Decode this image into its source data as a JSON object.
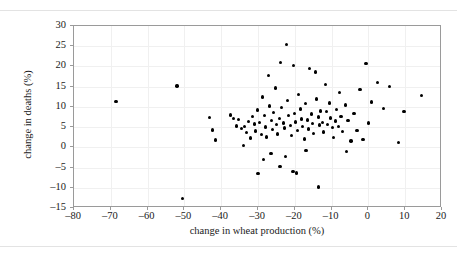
{
  "figure": {
    "caption_remnant": "",
    "background": "#ffffff",
    "frame_color": "#9a9a9a",
    "grid_color": "#f0f0f0",
    "point_color": "#000000"
  },
  "chart_data": {
    "type": "scatter",
    "title": "",
    "xlabel": "change in wheat production (%)",
    "ylabel": "change in deaths (%)",
    "xlim": [
      -80,
      20
    ],
    "ylim": [
      -15,
      30
    ],
    "xticks": [
      -80,
      -70,
      -60,
      -50,
      -40,
      -30,
      -20,
      -10,
      0,
      10,
      20
    ],
    "xticklabels": [
      "–80",
      "–70",
      "–60",
      "–50",
      "–40",
      "–30",
      "–20",
      "–10",
      "0",
      "10",
      "20"
    ],
    "yticks": [
      -15,
      -10,
      -5,
      0,
      5,
      10,
      15,
      20,
      25,
      30
    ],
    "yticklabels": [
      "–15",
      "–10",
      "–5",
      "0",
      "5",
      "10",
      "15",
      "20",
      "25",
      "30"
    ],
    "grid": true,
    "legend": null,
    "marker": "circle",
    "points": [
      [
        -68.6,
        11.4
      ],
      [
        -52.0,
        15.2
      ],
      [
        -50.6,
        -12.7
      ],
      [
        -43.2,
        7.4
      ],
      [
        -42.4,
        4.3
      ],
      [
        -41.6,
        1.8
      ],
      [
        -37.5,
        8.0
      ],
      [
        -36.7,
        7.1
      ],
      [
        -35.9,
        5.3
      ],
      [
        -35.3,
        6.9
      ],
      [
        -34.5,
        4.6
      ],
      [
        -33.7,
        5.1
      ],
      [
        -33.2,
        3.6
      ],
      [
        -32.6,
        6.4
      ],
      [
        -32.1,
        2.3
      ],
      [
        -31.5,
        7.6
      ],
      [
        -31.0,
        5.8
      ],
      [
        -30.7,
        4.0
      ],
      [
        -30.2,
        9.2
      ],
      [
        -29.6,
        6.1
      ],
      [
        -29.1,
        3.1
      ],
      [
        -28.8,
        12.4
      ],
      [
        -28.3,
        7.9
      ],
      [
        -28.0,
        5.0
      ],
      [
        -27.7,
        2.6
      ],
      [
        -27.2,
        17.8
      ],
      [
        -26.9,
        10.2
      ],
      [
        -26.4,
        6.6
      ],
      [
        -26.1,
        4.4
      ],
      [
        -25.8,
        8.6
      ],
      [
        -25.3,
        14.7
      ],
      [
        -25.0,
        5.6
      ],
      [
        -24.7,
        3.3
      ],
      [
        -24.2,
        7.2
      ],
      [
        -23.9,
        21.0
      ],
      [
        -23.6,
        9.8
      ],
      [
        -23.1,
        6.0
      ],
      [
        -22.8,
        4.8
      ],
      [
        -22.3,
        25.4
      ],
      [
        -22.0,
        11.6
      ],
      [
        -21.7,
        7.8
      ],
      [
        -21.2,
        5.4
      ],
      [
        -20.9,
        2.9
      ],
      [
        -20.4,
        20.2
      ],
      [
        -20.1,
        8.4
      ],
      [
        -19.8,
        6.3
      ],
      [
        -19.3,
        4.1
      ],
      [
        -19.0,
        13.0
      ],
      [
        -18.5,
        9.5
      ],
      [
        -18.2,
        7.0
      ],
      [
        -17.9,
        5.2
      ],
      [
        -17.4,
        2.1
      ],
      [
        -17.1,
        10.8
      ],
      [
        -16.6,
        6.8
      ],
      [
        -16.3,
        4.5
      ],
      [
        -16.0,
        19.5
      ],
      [
        -15.5,
        8.2
      ],
      [
        -15.2,
        5.9
      ],
      [
        -14.9,
        3.4
      ],
      [
        -14.4,
        18.6
      ],
      [
        -14.1,
        12.0
      ],
      [
        -13.6,
        7.5
      ],
      [
        -13.3,
        5.5
      ],
      [
        -13.0,
        9.0
      ],
      [
        -12.5,
        6.2
      ],
      [
        -12.2,
        3.8
      ],
      [
        -11.7,
        15.5
      ],
      [
        -11.4,
        8.8
      ],
      [
        -11.1,
        5.7
      ],
      [
        -10.6,
        11.0
      ],
      [
        -10.3,
        7.3
      ],
      [
        -9.8,
        4.9
      ],
      [
        -9.5,
        2.4
      ],
      [
        -9.0,
        6.5
      ],
      [
        -8.7,
        9.4
      ],
      [
        -8.2,
        5.1
      ],
      [
        -7.9,
        13.6
      ],
      [
        -7.4,
        7.7
      ],
      [
        -7.1,
        3.9
      ],
      [
        -6.3,
        10.5
      ],
      [
        -5.5,
        6.7
      ],
      [
        -4.7,
        1.6
      ],
      [
        -3.9,
        8.3
      ],
      [
        -3.1,
        4.2
      ],
      [
        -2.3,
        14.3
      ],
      [
        -1.5,
        2.0
      ],
      [
        -0.7,
        20.8
      ],
      [
        0.1,
        6.0
      ],
      [
        0.9,
        11.2
      ],
      [
        2.5,
        16.0
      ],
      [
        4.1,
        9.6
      ],
      [
        5.7,
        15.0
      ],
      [
        8.1,
        1.2
      ],
      [
        9.7,
        8.9
      ],
      [
        14.5,
        12.8
      ],
      [
        -30.0,
        -6.5
      ],
      [
        -28.5,
        -3.0
      ],
      [
        -26.5,
        -1.5
      ],
      [
        -24.0,
        -4.7
      ],
      [
        -22.5,
        -2.2
      ],
      [
        -20.5,
        -6.0
      ],
      [
        -19.5,
        -6.3
      ],
      [
        -17.0,
        -0.8
      ],
      [
        -13.5,
        -9.8
      ],
      [
        -6.0,
        -1.0
      ],
      [
        -34.0,
        0.5
      ]
    ]
  }
}
